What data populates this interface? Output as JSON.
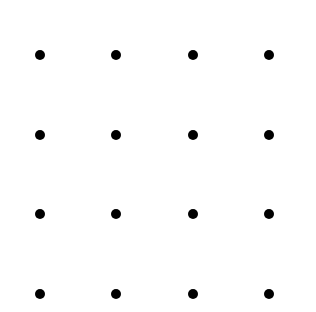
{
  "diagram": {
    "type": "dot-grid",
    "rows": 4,
    "cols": 4,
    "dot_color": "#000000",
    "background": "#ffffff",
    "dot_diameter_px": 10,
    "column_x": [
      40,
      116,
      193,
      269
    ],
    "row_y": [
      55,
      135,
      214,
      294
    ]
  }
}
